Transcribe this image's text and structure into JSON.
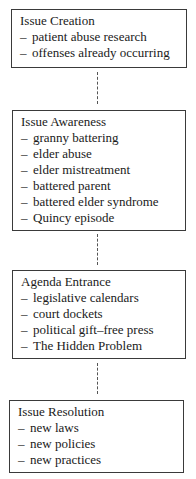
{
  "boxes": [
    {
      "title": "Issue Creation",
      "items": [
        "patient abuse research",
        "offenses already occurring"
      ]
    },
    {
      "title": "Issue Awareness",
      "items": [
        "granny battering",
        "elder abuse",
        "elder mistreatment",
        "battered parent",
        "battered elder syndrome",
        "Quincy episode"
      ]
    },
    {
      "title": "Agenda Entrance",
      "items": [
        "legislative calendars",
        "court dockets",
        "political gift–free press",
        "The Hidden Problem"
      ]
    },
    {
      "title": "Issue Resolution",
      "items": [
        "new laws",
        "new policies",
        "new practices"
      ]
    }
  ],
  "bullet": "–"
}
